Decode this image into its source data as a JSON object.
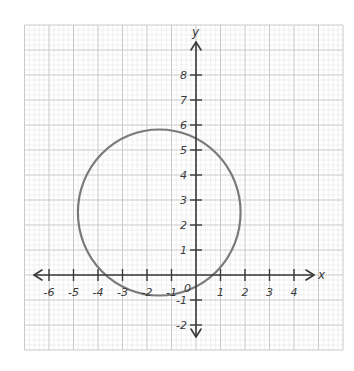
{
  "chart_data": {
    "type": "scatter",
    "title": "",
    "subtitle": "",
    "xlabel": "x",
    "ylabel": "y",
    "xlim": [
      -7,
      6
    ],
    "ylim": [
      -3,
      10
    ],
    "grid": true,
    "grid_minor_divisions": 5,
    "x_ticks": [
      -6,
      -5,
      -4,
      -3,
      -2,
      -1,
      1,
      2,
      3,
      4
    ],
    "x_tick_labels": [
      "-6",
      "-5",
      "-4",
      "-3",
      "-2",
      "-1",
      "1",
      "2",
      "3",
      "4"
    ],
    "y_ticks": [
      8,
      7,
      6,
      5,
      4,
      3,
      2,
      1,
      -1,
      -2
    ],
    "y_tick_labels": [
      "8",
      "7",
      "6",
      "5",
      "4",
      "3",
      "2",
      "1",
      "-1",
      "-2"
    ],
    "origin_label": "0",
    "series": [
      {
        "name": "circle",
        "shape": "circle",
        "center": [
          -1.5,
          2.5
        ],
        "radius": 3.32,
        "color": "#7a7a7a"
      }
    ],
    "legend": null
  },
  "colors": {
    "axis": "#3a3a3a",
    "grid_major": "#c9c9c9",
    "grid_minor": "#e6e6e6",
    "curve": "#7a7a7a"
  }
}
